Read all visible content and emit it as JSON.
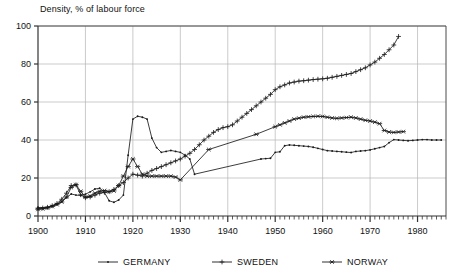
{
  "chart_data": {
    "type": "line",
    "title": "Density, % of labour force",
    "xlabel": "",
    "ylabel": "",
    "xlim": [
      1900,
      1986
    ],
    "ylim": [
      0,
      100
    ],
    "yticks": [
      0,
      20,
      40,
      60,
      80,
      100
    ],
    "xticks": [
      1900,
      1910,
      1920,
      1930,
      1940,
      1950,
      1960,
      1970,
      1980
    ],
    "grid": true,
    "legend_position": "bottom",
    "series": [
      {
        "name": "GERMANY",
        "marker": "dot",
        "points": [
          [
            1900,
            4.5
          ],
          [
            1901,
            4.3
          ],
          [
            1902,
            4.6
          ],
          [
            1903,
            5.4
          ],
          [
            1904,
            6.2
          ],
          [
            1905,
            7.6
          ],
          [
            1906,
            9.6
          ],
          [
            1907,
            11.6
          ],
          [
            1908,
            11.0
          ],
          [
            1909,
            10.8
          ],
          [
            1910,
            11.5
          ],
          [
            1911,
            12.7
          ],
          [
            1912,
            14.2
          ],
          [
            1913,
            14.6
          ],
          [
            1914,
            12.4
          ],
          [
            1915,
            8.0
          ],
          [
            1916,
            7.2
          ],
          [
            1917,
            8.4
          ],
          [
            1918,
            11.0
          ],
          [
            1919,
            32.0
          ],
          [
            1920,
            51.0
          ],
          [
            1921,
            52.5
          ],
          [
            1922,
            52.0
          ],
          [
            1923,
            51.0
          ],
          [
            1924,
            41.0
          ],
          [
            1925,
            36.0
          ],
          [
            1926,
            33.5
          ],
          [
            1927,
            34.0
          ],
          [
            1928,
            34.5
          ],
          [
            1929,
            34.0
          ],
          [
            1930,
            33.5
          ],
          [
            1931,
            32.0
          ],
          [
            1932,
            30.0
          ],
          [
            1933,
            22.0
          ],
          [
            1947,
            30.0
          ],
          [
            1948,
            30.2
          ],
          [
            1949,
            30.4
          ],
          [
            1950,
            33.5
          ],
          [
            1951,
            33.8
          ],
          [
            1952,
            37.0
          ],
          [
            1953,
            37.4
          ],
          [
            1954,
            37.2
          ],
          [
            1955,
            37.0
          ],
          [
            1956,
            36.8
          ],
          [
            1957,
            36.6
          ],
          [
            1958,
            36.2
          ],
          [
            1959,
            35.6
          ],
          [
            1960,
            35.0
          ],
          [
            1961,
            34.4
          ],
          [
            1962,
            34.2
          ],
          [
            1963,
            34.0
          ],
          [
            1964,
            33.8
          ],
          [
            1965,
            33.6
          ],
          [
            1966,
            33.4
          ],
          [
            1967,
            34.0
          ],
          [
            1968,
            34.2
          ],
          [
            1969,
            34.4
          ],
          [
            1970,
            34.8
          ],
          [
            1971,
            35.4
          ],
          [
            1972,
            36.0
          ],
          [
            1973,
            36.6
          ],
          [
            1974,
            38.6
          ],
          [
            1975,
            40.2
          ],
          [
            1976,
            40.0
          ],
          [
            1977,
            39.8
          ],
          [
            1978,
            39.6
          ],
          [
            1979,
            39.8
          ],
          [
            1980,
            40.0
          ],
          [
            1981,
            40.2
          ],
          [
            1982,
            40.2
          ],
          [
            1983,
            40.0
          ],
          [
            1984,
            40.0
          ],
          [
            1985,
            40.0
          ]
        ]
      },
      {
        "name": "SWEDEN",
        "marker": "plus",
        "points": [
          [
            1900,
            4.0
          ],
          [
            1901,
            4.2
          ],
          [
            1902,
            4.6
          ],
          [
            1903,
            5.4
          ],
          [
            1904,
            6.6
          ],
          [
            1905,
            8.8
          ],
          [
            1906,
            12.0
          ],
          [
            1907,
            16.0
          ],
          [
            1908,
            16.4
          ],
          [
            1909,
            11.2
          ],
          [
            1910,
            9.6
          ],
          [
            1911,
            10.0
          ],
          [
            1912,
            11.0
          ],
          [
            1913,
            12.0
          ],
          [
            1914,
            12.4
          ],
          [
            1915,
            12.8
          ],
          [
            1916,
            14.0
          ],
          [
            1917,
            16.0
          ],
          [
            1918,
            17.6
          ],
          [
            1919,
            20.0
          ],
          [
            1920,
            22.0
          ],
          [
            1921,
            21.5
          ],
          [
            1922,
            21.0
          ],
          [
            1923,
            22.5
          ],
          [
            1924,
            24.0
          ],
          [
            1925,
            25.0
          ],
          [
            1926,
            26.0
          ],
          [
            1927,
            27.0
          ],
          [
            1928,
            28.0
          ],
          [
            1929,
            29.0
          ],
          [
            1930,
            30.0
          ],
          [
            1931,
            31.5
          ],
          [
            1932,
            33.0
          ],
          [
            1933,
            35.0
          ],
          [
            1934,
            37.5
          ],
          [
            1935,
            40.0
          ],
          [
            1936,
            42.0
          ],
          [
            1937,
            44.0
          ],
          [
            1938,
            45.5
          ],
          [
            1939,
            46.5
          ],
          [
            1940,
            47.0
          ],
          [
            1941,
            48.0
          ],
          [
            1942,
            50.0
          ],
          [
            1943,
            52.0
          ],
          [
            1944,
            54.0
          ],
          [
            1945,
            56.0
          ],
          [
            1946,
            58.0
          ],
          [
            1947,
            60.0
          ],
          [
            1948,
            62.0
          ],
          [
            1949,
            64.0
          ],
          [
            1950,
            66.5
          ],
          [
            1951,
            68.0
          ],
          [
            1952,
            69.0
          ],
          [
            1953,
            70.0
          ],
          [
            1954,
            70.5
          ],
          [
            1955,
            71.0
          ],
          [
            1956,
            71.2
          ],
          [
            1957,
            71.5
          ],
          [
            1958,
            71.8
          ],
          [
            1959,
            72.0
          ],
          [
            1960,
            72.2
          ],
          [
            1961,
            72.5
          ],
          [
            1962,
            73.0
          ],
          [
            1963,
            73.5
          ],
          [
            1964,
            74.0
          ],
          [
            1965,
            74.5
          ],
          [
            1966,
            75.0
          ],
          [
            1967,
            76.0
          ],
          [
            1968,
            77.0
          ],
          [
            1969,
            78.0
          ],
          [
            1970,
            79.5
          ],
          [
            1971,
            81.0
          ],
          [
            1972,
            83.0
          ],
          [
            1973,
            85.0
          ],
          [
            1974,
            87.5
          ],
          [
            1975,
            90.0
          ],
          [
            1976,
            94.5
          ]
        ]
      },
      {
        "name": "NORWAY",
        "marker": "star",
        "points": [
          [
            1900,
            3.5
          ],
          [
            1901,
            3.8
          ],
          [
            1902,
            4.2
          ],
          [
            1903,
            5.0
          ],
          [
            1904,
            6.0
          ],
          [
            1905,
            7.4
          ],
          [
            1906,
            10.0
          ],
          [
            1907,
            15.0
          ],
          [
            1908,
            16.5
          ],
          [
            1909,
            13.0
          ],
          [
            1910,
            10.0
          ],
          [
            1911,
            10.5
          ],
          [
            1912,
            12.0
          ],
          [
            1913,
            13.0
          ],
          [
            1914,
            13.4
          ],
          [
            1915,
            12.8
          ],
          [
            1916,
            13.2
          ],
          [
            1917,
            16.0
          ],
          [
            1918,
            21.0
          ],
          [
            1919,
            26.0
          ],
          [
            1920,
            30.0
          ],
          [
            1921,
            26.0
          ],
          [
            1922,
            22.0
          ],
          [
            1923,
            21.0
          ],
          [
            1924,
            21.0
          ],
          [
            1925,
            21.0
          ],
          [
            1926,
            21.0
          ],
          [
            1927,
            21.0
          ],
          [
            1928,
            21.0
          ],
          [
            1929,
            20.5
          ],
          [
            1930,
            19.0
          ],
          [
            1936,
            35.0
          ],
          [
            1946,
            43.0
          ],
          [
            1950,
            47.0
          ],
          [
            1951,
            48.0
          ],
          [
            1952,
            49.0
          ],
          [
            1953,
            50.0
          ],
          [
            1954,
            51.0
          ],
          [
            1955,
            51.5
          ],
          [
            1956,
            52.0
          ],
          [
            1957,
            52.2
          ],
          [
            1958,
            52.4
          ],
          [
            1959,
            52.5
          ],
          [
            1960,
            52.4
          ],
          [
            1961,
            52.0
          ],
          [
            1962,
            51.6
          ],
          [
            1963,
            51.4
          ],
          [
            1964,
            51.6
          ],
          [
            1965,
            51.8
          ],
          [
            1966,
            52.0
          ],
          [
            1967,
            51.6
          ],
          [
            1968,
            51.0
          ],
          [
            1969,
            50.4
          ],
          [
            1970,
            50.0
          ],
          [
            1971,
            49.4
          ],
          [
            1972,
            48.6
          ],
          [
            1973,
            45.0
          ],
          [
            1974,
            44.2
          ],
          [
            1975,
            44.0
          ],
          [
            1976,
            44.2
          ],
          [
            1977,
            44.4
          ]
        ]
      }
    ],
    "legend": [
      {
        "label": "GERMANY",
        "marker": "dot"
      },
      {
        "label": "SWEDEN",
        "marker": "plus"
      },
      {
        "label": "NORWAY",
        "marker": "star"
      }
    ],
    "colors": {
      "line": "#1a1a1a",
      "grid": "#b4b4b4",
      "axis": "#4a4a4a",
      "background": "#ffffff"
    }
  }
}
